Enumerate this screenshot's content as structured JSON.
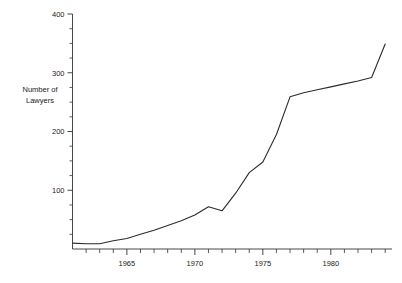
{
  "chart_data": {
    "type": "line",
    "title": "",
    "subtitle": "",
    "xlabel": "",
    "ylabel": "Number of\nLawyers",
    "ylabel_line1": "Number of",
    "ylabel_line2": "Lawyers",
    "xlim": [
      1961,
      1984.5
    ],
    "ylim": [
      0,
      400
    ],
    "grid": false,
    "legend": false,
    "legend_position": "none",
    "line_color": "#2b2b2b",
    "background_color": "#ffffff",
    "axis_color": "#333333",
    "y_ticks_major": [
      100,
      200,
      300,
      400
    ],
    "y_tick_labels": [
      "100",
      "200",
      "300",
      "400"
    ],
    "y_ticks_minor": [
      25,
      50,
      75,
      125,
      150,
      175,
      225,
      250,
      275,
      325,
      350,
      375
    ],
    "x_ticks_major": [
      1965,
      1970,
      1975,
      1980
    ],
    "x_tick_labels": [
      "1965",
      "1970",
      "1975",
      "1980"
    ],
    "x_ticks_minor": [
      1962,
      1963,
      1964,
      1966,
      1967,
      1968,
      1969,
      1971,
      1972,
      1973,
      1974,
      1976,
      1977,
      1978,
      1979,
      1981,
      1982,
      1983,
      1984
    ],
    "x": [
      1961,
      1962,
      1963,
      1964,
      1965,
      1966,
      1967,
      1968,
      1969,
      1970,
      1971,
      1972,
      1973,
      1974,
      1975,
      1976,
      1977,
      1978,
      1979,
      1980,
      1981,
      1982,
      1983,
      1984
    ],
    "values": [
      10,
      9,
      9,
      14,
      18,
      25,
      32,
      40,
      48,
      58,
      72,
      65,
      95,
      130,
      148,
      195,
      259,
      266,
      271,
      276,
      281,
      286,
      292,
      349
    ],
    "series": [
      {
        "name": "Number of Lawyers",
        "values": [
          10,
          9,
          9,
          14,
          18,
          25,
          32,
          40,
          48,
          58,
          72,
          65,
          95,
          130,
          148,
          195,
          259,
          266,
          271,
          276,
          281,
          286,
          292,
          349
        ]
      }
    ],
    "annotations": []
  }
}
